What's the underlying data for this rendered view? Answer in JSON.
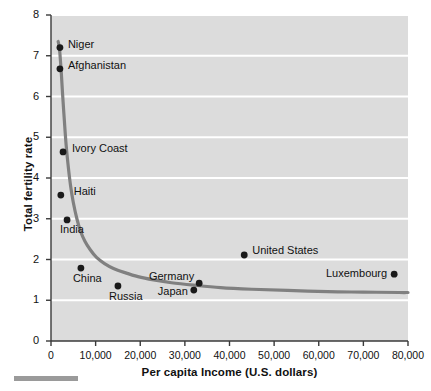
{
  "chart_data": {
    "type": "scatter",
    "title": "",
    "subtitle": "",
    "xlabel": "Per capita Income (U.S. dollars)",
    "ylabel": "Total fertility rate",
    "xlim": [
      0,
      80000
    ],
    "ylim": [
      0,
      8
    ],
    "xticks": [
      0,
      10000,
      20000,
      30000,
      40000,
      50000,
      60000,
      70000,
      80000
    ],
    "xtick_labels": [
      "0",
      "10,000",
      "20,000",
      "30,000",
      "40,000",
      "50,000",
      "60,000",
      "70,000",
      "80,000"
    ],
    "yticks": [
      0,
      1,
      2,
      3,
      4,
      5,
      6,
      7,
      8
    ],
    "ytick_labels": [
      "0",
      "1",
      "2",
      "3",
      "4",
      "5",
      "6",
      "7",
      "8"
    ],
    "grid": "horizontal-white-lines",
    "legend": "none",
    "plot_background": "#dcdcdc",
    "gridline_color": "#ffffff",
    "point_color": "#1a1a1a",
    "trendline_color": "#808080",
    "points": [
      {
        "label": "Niger",
        "x": 2000,
        "y": 7.2,
        "label_dx": 8,
        "label_dy": -4,
        "anchor": "start"
      },
      {
        "label": "Afghanistan",
        "x": 2000,
        "y": 6.68,
        "label_dx": 8,
        "label_dy": -4,
        "anchor": "start"
      },
      {
        "label": "Ivory Coast",
        "x": 2700,
        "y": 4.64,
        "label_dx": 9,
        "label_dy": -4,
        "anchor": "start"
      },
      {
        "label": "Haiti",
        "x": 2200,
        "y": 3.58,
        "label_dx": 13,
        "label_dy": -4,
        "anchor": "start"
      },
      {
        "label": "India",
        "x": 3600,
        "y": 2.97,
        "label_dx": -7,
        "label_dy": 9,
        "anchor": "start"
      },
      {
        "label": "China",
        "x": 6700,
        "y": 1.79,
        "label_dx": -8,
        "label_dy": 10,
        "anchor": "start"
      },
      {
        "label": "Russia",
        "x": 15000,
        "y": 1.35,
        "label_dx": -9,
        "label_dy": 10,
        "anchor": "start"
      },
      {
        "label": "Japan",
        "x": 32000,
        "y": 1.25,
        "label_dx": -6,
        "label_dy": 1,
        "anchor": "end"
      },
      {
        "label": "Germany",
        "x": 33200,
        "y": 1.42,
        "label_dx": -5,
        "label_dy": -7,
        "anchor": "end"
      },
      {
        "label": "United States",
        "x": 43300,
        "y": 2.11,
        "label_dx": 8,
        "label_dy": -5,
        "anchor": "start"
      },
      {
        "label": "Luxembourg",
        "x": 76900,
        "y": 1.64,
        "label_dx": -7,
        "label_dy": -1,
        "anchor": "end"
      }
    ],
    "trendline": {
      "description": "Hyperbolic decay fit of fertility rate versus per capita income",
      "x": [
        1600,
        1800,
        2000,
        2300,
        2600,
        3000,
        3400,
        3900,
        4400,
        5000,
        5800,
        6600,
        7600,
        8800,
        10200,
        12000,
        14000,
        16500,
        19500,
        23000,
        27000,
        32000,
        38000,
        45000,
        53000,
        62000,
        70000,
        78000,
        80000
      ],
      "y": [
        7.35,
        7.25,
        7.05,
        6.6,
        6.05,
        5.4,
        4.8,
        4.25,
        3.8,
        3.4,
        3.0,
        2.7,
        2.45,
        2.24,
        2.05,
        1.9,
        1.78,
        1.68,
        1.58,
        1.5,
        1.43,
        1.37,
        1.31,
        1.27,
        1.24,
        1.21,
        1.2,
        1.19,
        1.19
      ]
    }
  }
}
